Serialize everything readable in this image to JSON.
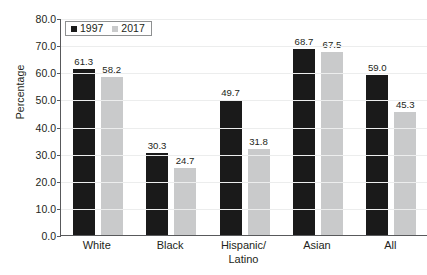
{
  "chart_data": {
    "type": "bar",
    "title": "",
    "subtitle": "",
    "xlabel": "",
    "ylabel": "Percentage",
    "ylim": [
      0,
      80
    ],
    "ytick_step": 10,
    "ytick_labels": [
      "0.0",
      "10.0",
      "20.0",
      "30.0",
      "40.0",
      "50.0",
      "60.0",
      "70.0",
      "80.0"
    ],
    "ytick_values": [
      0,
      10,
      20,
      30,
      40,
      50,
      60,
      70,
      80
    ],
    "grid": true,
    "grid_axis": "y",
    "legend_position": "top-left",
    "categories": [
      "White",
      "Black",
      "Hispanic/\nLatino",
      "Asian",
      "All"
    ],
    "series": [
      {
        "name": "1997",
        "color": "#1a1a1a",
        "values": [
          61.3,
          30.3,
          49.7,
          68.7,
          59.0
        ],
        "labels": [
          "61.3",
          "30.3",
          "49.7",
          "68.7",
          "59.0"
        ]
      },
      {
        "name": "2017",
        "color": "#c9cacb",
        "values": [
          58.2,
          24.7,
          31.8,
          67.5,
          45.3
        ],
        "labels": [
          "58.2",
          "24.7",
          "31.8",
          "67.5",
          "45.3"
        ]
      }
    ]
  },
  "legend": {
    "items": [
      {
        "label": "1997",
        "swatch_class": "s1997",
        "icon": "legend-square-black"
      },
      {
        "label": "2017",
        "swatch_class": "s2017",
        "icon": "legend-square-gray"
      }
    ]
  },
  "colors": {
    "series_1997": "#1a1a1a",
    "series_2017": "#c9cacb",
    "axis": "#58595b",
    "gridline": "#eceded",
    "text": "#231f20",
    "background": "#ffffff"
  }
}
